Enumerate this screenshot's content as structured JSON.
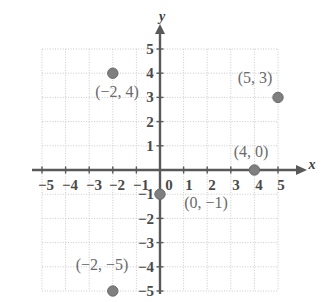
{
  "figure": {
    "type": "coordinate-plane",
    "title": "",
    "width": 328,
    "height": 302
  },
  "colors": {
    "background": "#ffffff",
    "grid": "#c9c9c9",
    "axis": "#595959",
    "point_fill": "#7f7f7f",
    "point_stroke": "#6b6b6b",
    "tick_text": "#4a4a4a",
    "label_text": "#6a6a6a"
  },
  "chart_data": {
    "type": "scatter",
    "title": "",
    "xlabel": "x",
    "ylabel": "y",
    "xlim": [
      -5,
      5
    ],
    "ylim": [
      -5,
      5
    ],
    "grid": true,
    "legend": "none",
    "x_ticks": [
      "-5",
      "-4",
      "-3",
      "-2",
      "-1",
      "0",
      "1",
      "2",
      "3",
      "4",
      "5"
    ],
    "y_ticks": [
      "5",
      "4",
      "3",
      "2",
      "1",
      "-1",
      "-2",
      "-3",
      "-4",
      "-5"
    ],
    "points": [
      {
        "x": -2,
        "y": 4,
        "label": "(−2, 4)"
      },
      {
        "x": 5,
        "y": 3,
        "label": "(5, 3)"
      },
      {
        "x": 4,
        "y": 0,
        "label": "(4, 0)"
      },
      {
        "x": 0,
        "y": -1,
        "label": "(0, −1)"
      },
      {
        "x": -2,
        "y": -5,
        "label": "(−2, −5)"
      }
    ]
  },
  "axes": {
    "x_name": "x",
    "y_name": "y"
  },
  "x_tick_labels": [
    {
      "text": "−5",
      "px": 46,
      "py": 185
    },
    {
      "text": "−4",
      "px": 70,
      "py": 185
    },
    {
      "text": "−3",
      "px": 94,
      "py": 185
    },
    {
      "text": "−2",
      "px": 117,
      "py": 185
    },
    {
      "text": "−1",
      "px": 141,
      "py": 185
    },
    {
      "text": "0",
      "px": 169,
      "py": 185
    },
    {
      "text": "1",
      "px": 189,
      "py": 185
    },
    {
      "text": "2",
      "px": 212,
      "py": 185
    },
    {
      "text": "3",
      "px": 236,
      "py": 185
    },
    {
      "text": "4",
      "px": 259,
      "py": 185
    },
    {
      "text": "5",
      "px": 281,
      "py": 185
    }
  ],
  "y_tick_labels": [
    {
      "text": "5",
      "px": 150,
      "py": 49
    },
    {
      "text": "4",
      "px": 150,
      "py": 73
    },
    {
      "text": "3",
      "px": 150,
      "py": 97
    },
    {
      "text": "2",
      "px": 150,
      "py": 122
    },
    {
      "text": "1",
      "px": 150,
      "py": 146
    },
    {
      "text": "−1",
      "px": 146,
      "py": 194
    },
    {
      "text": "−2",
      "px": 146,
      "py": 219
    },
    {
      "text": "−3",
      "px": 146,
      "py": 243
    },
    {
      "text": "−4",
      "px": 146,
      "py": 267
    },
    {
      "text": "−5",
      "px": 146,
      "py": 291
    }
  ],
  "point_labels": [
    {
      "text": "(−2, 4)",
      "px": 117,
      "py": 92
    },
    {
      "text": "(5, 3)",
      "px": 255,
      "py": 78
    },
    {
      "text": "(4, 0)",
      "px": 251,
      "py": 152
    },
    {
      "text": "(0, −1)",
      "px": 206,
      "py": 203
    },
    {
      "text": "(−2, −5)",
      "px": 102,
      "py": 265
    }
  ],
  "axis_names": [
    {
      "text": "x",
      "px": 312,
      "py": 165
    },
    {
      "text": "y",
      "px": 162,
      "py": 17
    }
  ]
}
